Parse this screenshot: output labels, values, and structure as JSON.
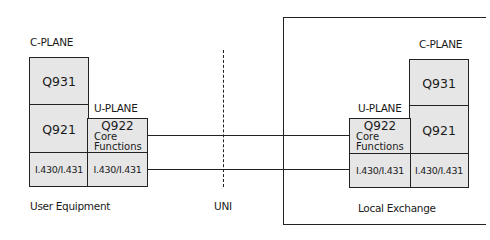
{
  "user_equipment": {
    "c_plane_label": "C-PLANE",
    "u_plane_label": "U-PLANE",
    "c_plane_layers": [
      "Q931",
      "Q921",
      "I.430/I.431"
    ],
    "u_plane_layers": {
      "q922": "Q922",
      "core_line1": "Core",
      "core_line2": "Functions",
      "physical": "I.430/I.431"
    },
    "caption": "User Equipment"
  },
  "interface": {
    "label": "UNI"
  },
  "local_exchange": {
    "c_plane_label": "C-PLANE",
    "u_plane_label": "U-PLANE",
    "c_plane_layers": [
      "Q931",
      "Q921",
      "I.430/I.431"
    ],
    "u_plane_layers": {
      "q922": "Q922",
      "core_line1": "Core",
      "core_line2": "Functions",
      "physical": "I.430/I.431"
    },
    "caption": "Local Exchange"
  },
  "colors": {
    "box_fill": "#e6e6e6",
    "stroke": "#222222"
  }
}
